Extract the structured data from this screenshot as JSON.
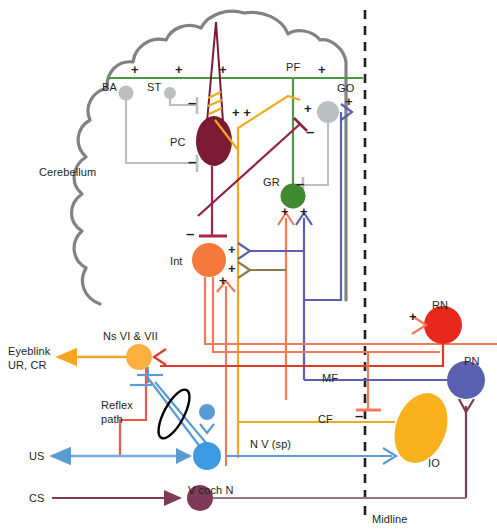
{
  "figure": {
    "title_region": "cerebellar eyeblink conditioning circuit",
    "midline_label": "Midline"
  },
  "colors": {
    "cerebellum_outline": "#808285",
    "pf_green": "#4a9a45",
    "granule_green": "#3f8a32",
    "purkinje_maroon": "#7b1a32",
    "interposed_orange": "#f4793b",
    "golgi_gray": "#bcbec0",
    "basket_gray": "#bcbec0",
    "gray_line": "#bcbec0",
    "mossy_blue": "#5b5fb0",
    "climbing_gold": "#f5a81c",
    "red_nucleus_red": "#e8281c",
    "salmon": "#f07a5a",
    "ns_orange": "#fbb040",
    "light_blue": "#5b9bd5",
    "cochlear_purple": "#7e3a57",
    "olive": "#8c7a4a",
    "io_yellow": "#f9b21d",
    "text": "#231f20"
  },
  "nodes": [
    {
      "id": "BA",
      "label": "BA",
      "type": "interneuron",
      "color": "#bcbec0"
    },
    {
      "id": "ST",
      "label": "ST",
      "type": "interneuron",
      "color": "#bcbec0"
    },
    {
      "id": "PC",
      "label": "PC",
      "type": "purkinje",
      "color": "#7b1a32"
    },
    {
      "id": "GO",
      "label": "GO",
      "type": "golgi",
      "color": "#bcbec0"
    },
    {
      "id": "GR",
      "label": "GR",
      "type": "granule",
      "color": "#3f8a32"
    },
    {
      "id": "Int",
      "label": "Int",
      "type": "nucleus",
      "color": "#f4793b"
    },
    {
      "id": "RN",
      "label": "RN",
      "type": "nucleus",
      "color": "#e8281c"
    },
    {
      "id": "PN",
      "label": "PN",
      "type": "nucleus",
      "color": "#5b5fb0"
    },
    {
      "id": "IO",
      "label": "IO",
      "type": "nucleus",
      "color": "#f9b21d"
    },
    {
      "id": "N6N7",
      "label": "Ns VI & VII",
      "type": "nucleus",
      "color": "#fbb040"
    },
    {
      "id": "NV",
      "label": "N V (sp)",
      "type": "nucleus",
      "color": "#5b9bd5"
    },
    {
      "id": "VCN",
      "label": "V coch N",
      "type": "nucleus",
      "color": "#7e3a57"
    }
  ],
  "labels": {
    "cerebellum": "Cerebellum",
    "ba": "BA",
    "st": "ST",
    "pc": "PC",
    "pf": "PF",
    "go": "GO",
    "gr": "GR",
    "int": "Int",
    "rn": "RN",
    "pn": "PN",
    "io": "IO",
    "mf": "MF",
    "cf": "CF",
    "ns_vi_vii": "Ns VI & VII",
    "eyeblink_line1": "Eyeblink",
    "eyeblink_line2": "UR, CR",
    "reflex_line1": "Reflex",
    "reflex_line2": "path",
    "us": "US",
    "cs": "CS",
    "nv_sp": "N V (sp)",
    "v_coch_n": "V coch N",
    "midline": "Midline"
  },
  "signs": {
    "plus": "+",
    "minus": "–",
    "plus_plus": "+ +"
  },
  "sign_markers": [
    {
      "id": "pf-plus-1",
      "sign": "+",
      "x": 131,
      "y": 65
    },
    {
      "id": "pf-plus-2",
      "sign": "+",
      "x": 175,
      "y": 65
    },
    {
      "id": "pf-plus-3",
      "sign": "+",
      "x": 219,
      "y": 65
    },
    {
      "id": "pf-plus-4",
      "sign": "+",
      "x": 318,
      "y": 65
    },
    {
      "id": "st-minus",
      "sign": "–",
      "x": 197,
      "y": 100
    },
    {
      "id": "ba-minus",
      "sign": "–",
      "x": 197,
      "y": 160
    },
    {
      "id": "pc-plusplus",
      "sign": "+ +",
      "x": 232,
      "y": 111
    },
    {
      "id": "go-plus-in",
      "sign": "+",
      "x": 305,
      "y": 106
    },
    {
      "id": "go-plus-mf",
      "sign": "+",
      "x": 340,
      "y": 101
    },
    {
      "id": "go-minus",
      "sign": "–",
      "x": 315,
      "y": 131
    },
    {
      "id": "gr-minus",
      "sign": "–",
      "x": 306,
      "y": 175
    },
    {
      "id": "gr-plus-l",
      "sign": "+",
      "x": 283,
      "y": 212
    },
    {
      "id": "gr-plus-r",
      "sign": "+",
      "x": 305,
      "y": 212
    },
    {
      "id": "int-minus",
      "sign": "–",
      "x": 187,
      "y": 238
    },
    {
      "id": "int-plus-mf",
      "sign": "+",
      "x": 228,
      "y": 246
    },
    {
      "id": "int-plus-cf",
      "sign": "+",
      "x": 228,
      "y": 265
    },
    {
      "id": "int-plus-dn",
      "sign": "+",
      "x": 225,
      "y": 280
    },
    {
      "id": "rn-plus",
      "sign": "+",
      "x": 414,
      "y": 318
    },
    {
      "id": "io-minus",
      "sign": "–",
      "x": 389,
      "y": 410
    }
  ],
  "pathways": [
    {
      "name": "parallel-fiber",
      "abbrev": "PF",
      "color": "#4a9a45"
    },
    {
      "name": "mossy-fiber",
      "abbrev": "MF",
      "color": "#5b5fb0"
    },
    {
      "name": "climbing-fiber",
      "abbrev": "CF",
      "color": "#f5a81c"
    },
    {
      "name": "interposed-output",
      "abbrev": "Int",
      "color": "#f07a5a"
    },
    {
      "name": "trigeminal",
      "abbrev": "N V (sp)",
      "color": "#5b9bd5"
    },
    {
      "name": "cochlear",
      "abbrev": "V coch N",
      "color": "#7e3a57"
    },
    {
      "name": "motor-output",
      "abbrev": "Eyeblink UR, CR",
      "color": "#fbb040"
    }
  ]
}
